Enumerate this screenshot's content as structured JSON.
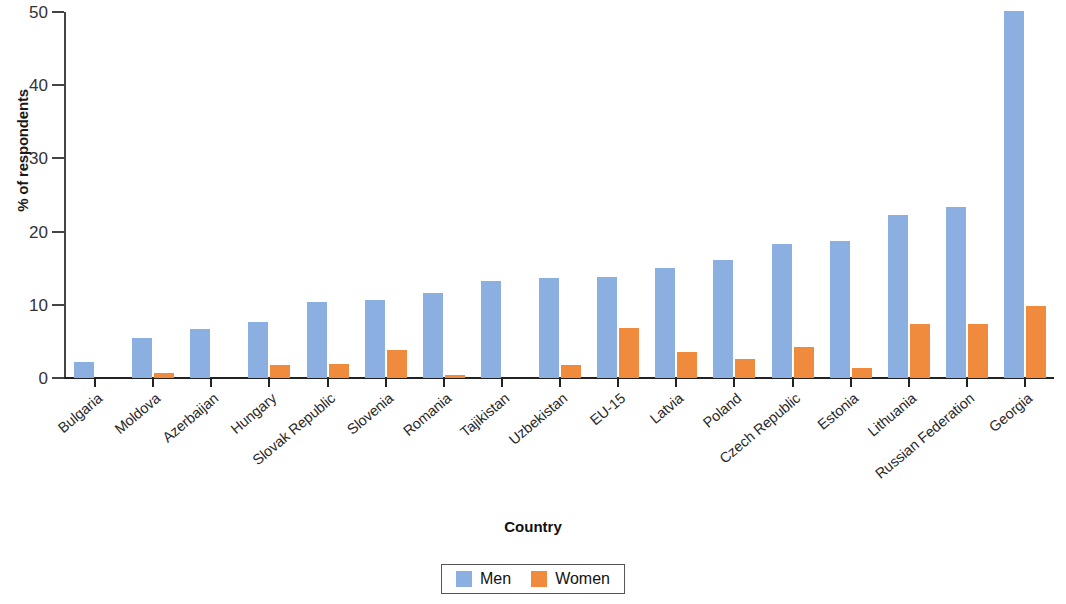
{
  "chart_data": {
    "type": "bar",
    "title": "",
    "xlabel": "Country",
    "ylabel": "% of respondents",
    "ylim": [
      0,
      50
    ],
    "yticks": [
      0,
      10,
      20,
      30,
      40,
      50
    ],
    "grid": false,
    "legend_position": "bottom-center",
    "categories": [
      "Bulgaria",
      "Moldova",
      "Azerbaijan",
      "Hungary",
      "Slovak Republic",
      "Slovenia",
      "Romania",
      "Tajikistan",
      "Uzbekistan",
      "EU-15",
      "Latvia",
      "Poland",
      "Czech Republic",
      "Estonia",
      "Lithuania",
      "Russian Federation",
      "Georgia"
    ],
    "series": [
      {
        "name": "Men",
        "color": "#8cafe1",
        "values": [
          2.2,
          5.5,
          6.7,
          7.6,
          10.4,
          10.6,
          11.6,
          13.2,
          13.6,
          13.8,
          15.0,
          16.1,
          18.3,
          18.7,
          22.3,
          23.4,
          50.2
        ]
      },
      {
        "name": "Women",
        "color": "#f08a3c",
        "values": [
          0.0,
          0.7,
          0.0,
          1.8,
          1.9,
          3.8,
          0.4,
          0.0,
          1.8,
          6.8,
          3.5,
          2.6,
          4.2,
          1.3,
          7.4,
          7.4,
          9.8
        ]
      }
    ]
  },
  "legend": {
    "items": [
      {
        "label": "Men",
        "color": "#8cafe1"
      },
      {
        "label": "Women",
        "color": "#f08a3c"
      }
    ]
  }
}
